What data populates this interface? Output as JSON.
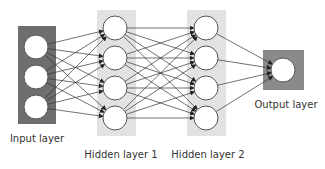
{
  "diagram": {
    "colors": {
      "input_box": "#6e6e6e",
      "hidden_box": "#e2e2e2",
      "output_box": "#8a8a8a",
      "node_fill": "#ffffff",
      "node_stroke": "#555555",
      "edge": "#333333",
      "label": "#333333"
    },
    "node_radius": 12,
    "layers": [
      {
        "id": "input",
        "label": "Input layer",
        "box": {
          "x": 18,
          "y": 26,
          "w": 38,
          "h": 98,
          "color": "#6e6e6e"
        },
        "nodes": [
          {
            "x": 36,
            "y": 47
          },
          {
            "x": 36,
            "y": 77
          },
          {
            "x": 36,
            "y": 107
          }
        ],
        "label_pos": {
          "x": 37,
          "y": 139
        }
      },
      {
        "id": "hidden1",
        "label": "Hidden layer 1",
        "box": {
          "x": 97,
          "y": 10,
          "w": 39,
          "h": 126,
          "color": "#e2e2e2"
        },
        "nodes": [
          {
            "x": 115,
            "y": 28
          },
          {
            "x": 115,
            "y": 58
          },
          {
            "x": 115,
            "y": 88
          },
          {
            "x": 115,
            "y": 118
          }
        ],
        "label_pos": {
          "x": 121,
          "y": 155
        }
      },
      {
        "id": "hidden2",
        "label": "Hidden layer 2",
        "box": {
          "x": 187,
          "y": 10,
          "w": 39,
          "h": 126,
          "color": "#e2e2e2"
        },
        "nodes": [
          {
            "x": 206,
            "y": 28
          },
          {
            "x": 206,
            "y": 58
          },
          {
            "x": 206,
            "y": 88
          },
          {
            "x": 206,
            "y": 118
          }
        ],
        "label_pos": {
          "x": 208,
          "y": 155
        }
      },
      {
        "id": "output",
        "label": "Output layer",
        "box": {
          "x": 263,
          "y": 50,
          "w": 41,
          "h": 40,
          "color": "#8a8a8a"
        },
        "nodes": [
          {
            "x": 283,
            "y": 70
          }
        ],
        "label_pos": {
          "x": 286,
          "y": 105
        }
      }
    ],
    "connections": "fully-connected between consecutive layers, arrows pointing right"
  }
}
